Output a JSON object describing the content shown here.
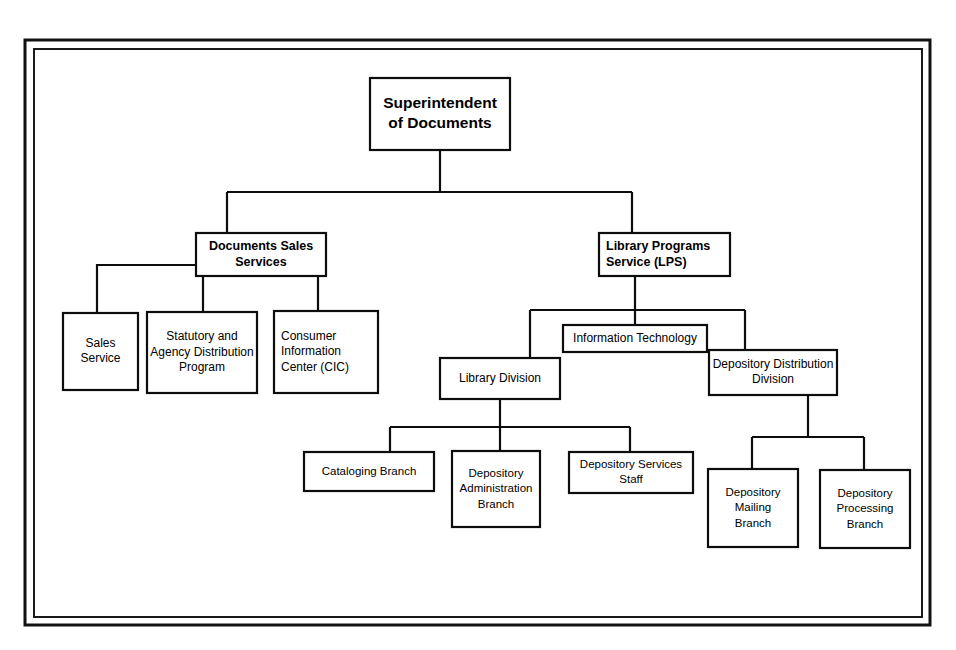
{
  "figure": {
    "background_color": "#ffffff",
    "line_color": "#0d0d0d",
    "box_fill": "#ffffff"
  },
  "frame": {
    "outer": {
      "x": 25,
      "y": 40,
      "width": 905,
      "height": 585
    },
    "inner": {
      "x": 34,
      "y": 49,
      "width": 888,
      "height": 568
    }
  },
  "nodes": [
    {
      "id": "superintendent",
      "name": "superintendent-of-documents",
      "lines": [
        "Superintendent",
        "of Documents"
      ],
      "level": "root",
      "align": "center",
      "box": {
        "x": 370,
        "y": 78,
        "width": 140,
        "height": 72
      }
    },
    {
      "id": "documents_sales_services",
      "name": "documents-sales-services",
      "lines": [
        "Documents Sales",
        "Services"
      ],
      "level": "lvl2",
      "align": "center",
      "box": {
        "x": 196,
        "y": 233,
        "width": 130,
        "height": 43
      }
    },
    {
      "id": "library_programs_service",
      "name": "library-programs-service",
      "lines": [
        "Library Programs",
        "Service (LPS)"
      ],
      "level": "lvl2",
      "align": "start",
      "box": {
        "x": 599,
        "y": 233,
        "width": 131,
        "height": 43
      }
    },
    {
      "id": "sales_service",
      "name": "sales-service",
      "lines": [
        "Sales",
        "Service"
      ],
      "level": "lvl3",
      "align": "center",
      "box": {
        "x": 63,
        "y": 313,
        "width": 75,
        "height": 77
      }
    },
    {
      "id": "statutory_agency_distribution_program",
      "name": "statutory-and-agency-distribution-program",
      "lines": [
        "Statutory and",
        "Agency Distribution",
        "Program"
      ],
      "level": "lvl3",
      "align": "center",
      "box": {
        "x": 147,
        "y": 312,
        "width": 110,
        "height": 81
      }
    },
    {
      "id": "consumer_information_center",
      "name": "consumer-information-center",
      "lines": [
        "Consumer",
        "Information",
        "Center (CIC)"
      ],
      "level": "lvl3",
      "align": "start",
      "box": {
        "x": 274,
        "y": 311,
        "width": 104,
        "height": 82
      }
    },
    {
      "id": "information_technology",
      "name": "information-technology",
      "lines": [
        "Information Technology"
      ],
      "level": "lvl3",
      "align": "center",
      "box": {
        "x": 563,
        "y": 325,
        "width": 144,
        "height": 27
      }
    },
    {
      "id": "library_division",
      "name": "library-division",
      "lines": [
        "Library Division"
      ],
      "level": "lvl3",
      "align": "center",
      "box": {
        "x": 440,
        "y": 358,
        "width": 120,
        "height": 41
      }
    },
    {
      "id": "depository_distribution_division",
      "name": "depository-distribution-division",
      "lines": [
        "Depository Distribution",
        "Division"
      ],
      "level": "lvl3",
      "align": "center",
      "box": {
        "x": 709,
        "y": 350,
        "width": 128,
        "height": 45
      }
    },
    {
      "id": "cataloging_branch",
      "name": "cataloging-branch",
      "lines": [
        "Cataloging Branch"
      ],
      "level": "lvl4",
      "align": "center",
      "box": {
        "x": 304,
        "y": 452,
        "width": 130,
        "height": 39
      }
    },
    {
      "id": "depository_administration_branch",
      "name": "depository-administration-branch",
      "lines": [
        "Depository",
        "Administration",
        "Branch"
      ],
      "level": "lvl4",
      "align": "center",
      "box": {
        "x": 452,
        "y": 451,
        "width": 88,
        "height": 76
      }
    },
    {
      "id": "depository_services_staff",
      "name": "depository-services-staff",
      "lines": [
        "Depository Services",
        "Staff"
      ],
      "level": "lvl4",
      "align": "center",
      "box": {
        "x": 569,
        "y": 452,
        "width": 124,
        "height": 41
      }
    },
    {
      "id": "depository_mailing_branch",
      "name": "depository-mailing-branch",
      "lines": [
        "Depository",
        "Mailing",
        "Branch"
      ],
      "level": "lvl4",
      "align": "center",
      "box": {
        "x": 708,
        "y": 469,
        "width": 90,
        "height": 78
      }
    },
    {
      "id": "depository_processing_branch",
      "name": "depository-processing-branch",
      "lines": [
        "Depository",
        "Processing",
        "Branch"
      ],
      "level": "lvl4",
      "align": "center",
      "box": {
        "x": 820,
        "y": 470,
        "width": 90,
        "height": 78
      }
    }
  ],
  "connectors": [
    {
      "id": "root-to-level2-bus",
      "name": "connector-superintendent-to-level2",
      "from": "superintendent",
      "to": [
        "documents_sales_services",
        "library_programs_service"
      ],
      "path": "M 440,150 L 440,192 M 227,192 L 632,192 M 227,192 L 227,233 M 632,192 L 632,233"
    },
    {
      "id": "dss-to-sales-service",
      "name": "connector-documents-sales-to-sales-service",
      "from": "documents_sales_services",
      "to": [
        "sales_service"
      ],
      "path": "M 196,265 L 97,265 L 97,313"
    },
    {
      "id": "dss-to-statutory",
      "name": "connector-documents-sales-to-statutory",
      "from": "documents_sales_services",
      "to": [
        "statutory_agency_distribution_program"
      ],
      "path": "M 203,276 L 203,312"
    },
    {
      "id": "dss-to-cic",
      "name": "connector-documents-sales-to-cic",
      "from": "documents_sales_services",
      "to": [
        "consumer_information_center"
      ],
      "path": "M 318,276 L 318,311"
    },
    {
      "id": "lps-to-children-bus",
      "name": "connector-lps-to-children",
      "from": "library_programs_service",
      "to": [
        "library_division",
        "information_technology",
        "depository_distribution_division"
      ],
      "path": "M 635,276 L 635,310 M 530,310 L 745,310 M 530,310 L 530,358 M 635,310 L 635,325 M 745,310 L 745,350"
    },
    {
      "id": "library-division-to-children-bus",
      "name": "connector-library-division-to-children",
      "from": "library_division",
      "to": [
        "cataloging_branch",
        "depository_administration_branch",
        "depository_services_staff"
      ],
      "path": "M 500,399 L 500,427 M 390,427 L 630,427 M 390,427 L 390,452 M 500,427 L 500,451 M 630,427 L 630,452"
    },
    {
      "id": "ddd-to-children-bus",
      "name": "connector-depository-distribution-to-children",
      "from": "depository_distribution_division",
      "to": [
        "depository_mailing_branch",
        "depository_processing_branch"
      ],
      "path": "M 808,395 L 808,437 M 752,437 L 864,437 M 752,437 L 752,469 M 864,437 L 864,470"
    }
  ]
}
